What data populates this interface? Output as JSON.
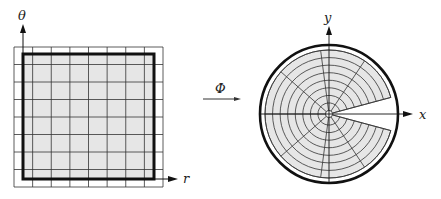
{
  "figure": {
    "left_panel": {
      "axis_vertical_label": "θ",
      "axis_horizontal_label": "r",
      "grid": {
        "x0": 14,
        "x1": 163,
        "y0": 47,
        "y1": 187,
        "cols": 8,
        "rows": 8
      },
      "domain_box": {
        "x0": 23,
        "y0": 54,
        "x1": 154,
        "y1": 179
      },
      "shade_color": "#e6e6e6"
    },
    "mapping": {
      "label": "Φ"
    },
    "right_panel": {
      "axis_vertical_label": "y",
      "axis_horizontal_label": "x",
      "center": [
        329,
        114
      ],
      "outer_circle_radius": 69,
      "region_outer_radius": 64,
      "region_inner_radius": 3.5,
      "rings": 8,
      "angle_start_deg": 15,
      "angle_end_deg": 345,
      "sectors": 8,
      "shade_color": "#e6e6e6"
    },
    "colors": {
      "line": "#333333",
      "bold": "#111111"
    }
  }
}
